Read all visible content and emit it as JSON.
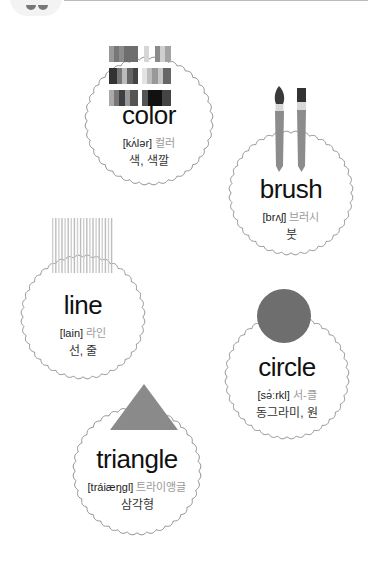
{
  "cards": [
    {
      "id": "color",
      "word": "color",
      "pron": "[kʌ́lər]",
      "pron_ko": "컬러",
      "meaning": "색, 색깔",
      "icon": "color-swatches-icon"
    },
    {
      "id": "brush",
      "word": "brush",
      "pron": "[brʌʃ]",
      "pron_ko": "브러시",
      "meaning": "붓",
      "icon": "paint-brushes-icon"
    },
    {
      "id": "line",
      "word": "line",
      "pron": "[lain]",
      "pron_ko": "라인",
      "meaning": "선, 줄",
      "icon": "vertical-lines-icon"
    },
    {
      "id": "circle",
      "word": "circle",
      "pron": "[sə́ːrkl]",
      "pron_ko": "서-클",
      "meaning": "동그라미, 원",
      "icon": "circle-shape-icon"
    },
    {
      "id": "triangle",
      "word": "triangle",
      "pron": "[tráiæŋgl]",
      "pron_ko": "트라이앵글",
      "meaning": "삼각형",
      "icon": "triangle-shape-icon"
    }
  ],
  "colors": {
    "shape_fill": "#8a8a8a",
    "circle_fill": "#6e6e6e",
    "scallop_stroke": "#777777",
    "pron_ko": "#999999"
  }
}
